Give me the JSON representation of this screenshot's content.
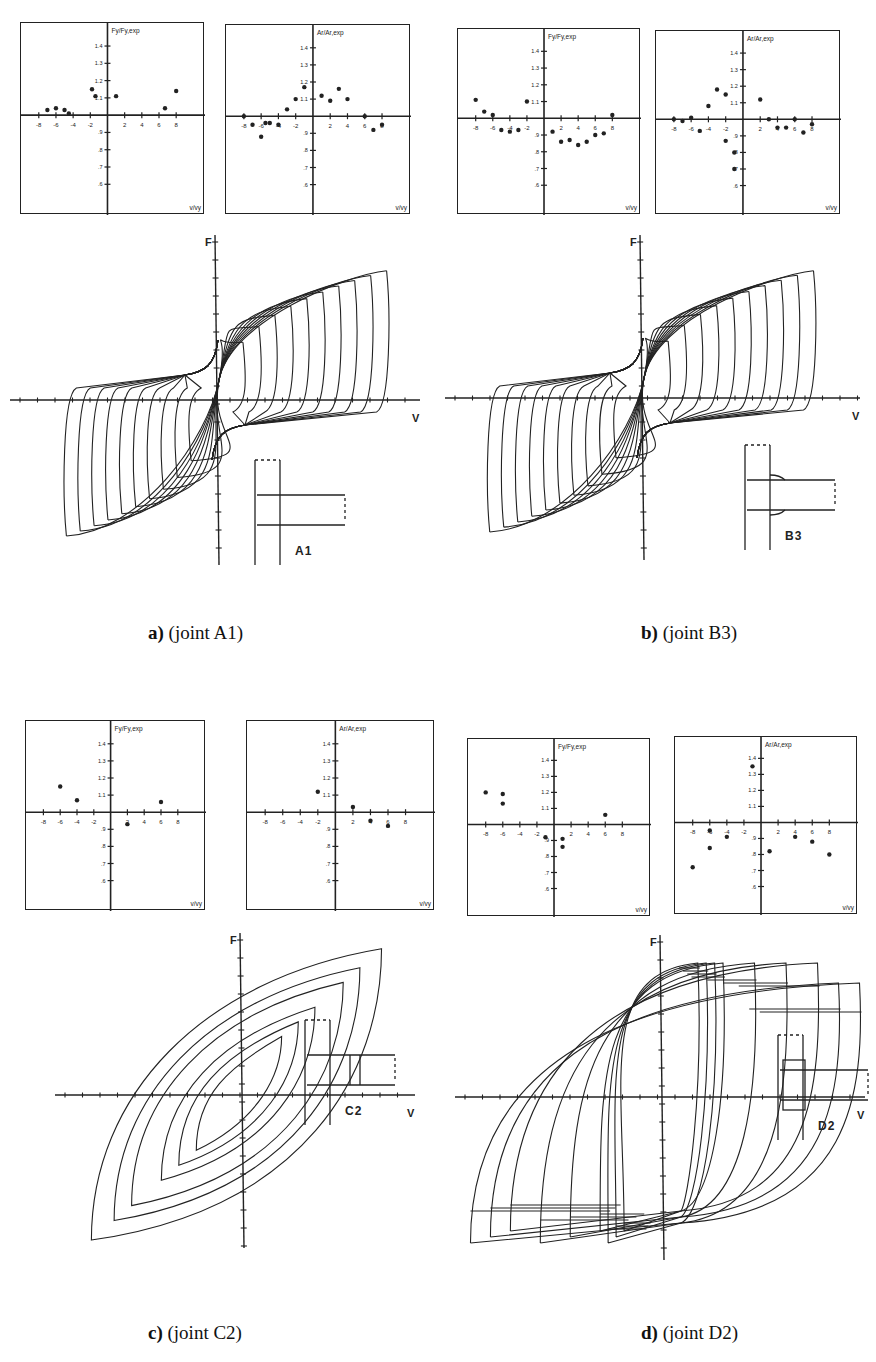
{
  "figure": {
    "panels": [
      {
        "id": "a",
        "caption_letter": "a)",
        "caption_text": " (joint A1)",
        "joint": "A1"
      },
      {
        "id": "b",
        "caption_letter": "b)",
        "caption_text": " (joint B3)",
        "joint": "B3"
      },
      {
        "id": "c",
        "caption_letter": "c)",
        "caption_text": " (joint C2)",
        "joint": "C2"
      },
      {
        "id": "d",
        "caption_letter": "d)",
        "caption_text": " (joint D2)",
        "joint": "D2"
      }
    ],
    "axis_labels": {
      "force_ratio": "Fy/Fy,exp",
      "area_ratio": "Ar/Ar,exp",
      "x_ratio": "v/vy",
      "hyst_y": "F",
      "hyst_x": "V"
    }
  },
  "chart_data": [
    {
      "panel": "a",
      "type": "scatter",
      "title": "Fy/Fy,exp vs v/vy (joint A1)",
      "xlabel": "v/vy",
      "ylabel": "Fy/Fy,exp",
      "xlim": [
        -10,
        10
      ],
      "ylim": [
        0.5,
        1.5
      ],
      "xticks": [
        -8,
        -6,
        -4,
        -2,
        2,
        4,
        6,
        8
      ],
      "yticks": [
        0.6,
        0.7,
        0.8,
        0.9,
        1.1,
        1.2,
        1.3,
        1.4
      ],
      "x": [
        -7,
        -6,
        -5,
        -4.5,
        -1.8,
        -1.4,
        1,
        6.7,
        8
      ],
      "y": [
        1.03,
        1.04,
        1.03,
        1.01,
        1.15,
        1.11,
        1.11,
        1.04,
        1.14
      ]
    },
    {
      "panel": "a",
      "type": "scatter",
      "title": "Ar/Ar,exp vs v/vy (joint A1)",
      "xlabel": "v/vy",
      "ylabel": "Ar/Ar,exp",
      "xlim": [
        -10,
        10
      ],
      "ylim": [
        0.5,
        1.5
      ],
      "xticks": [
        -8,
        -6,
        -4,
        -2,
        2,
        4,
        6,
        8
      ],
      "yticks": [
        0.6,
        0.7,
        0.8,
        0.9,
        1.1,
        1.2,
        1.3,
        1.4
      ],
      "x": [
        -8,
        -7,
        -6,
        -5.5,
        -5,
        -4,
        -3,
        -2,
        -1,
        1,
        2,
        3,
        4,
        6,
        7,
        8
      ],
      "y": [
        1.0,
        0.95,
        0.88,
        0.96,
        0.96,
        0.95,
        1.04,
        1.1,
        1.17,
        1.12,
        1.09,
        1.16,
        1.1,
        1.0,
        0.92,
        0.95
      ]
    },
    {
      "panel": "b",
      "type": "scatter",
      "title": "Fy/Fy,exp vs v/vy (joint B3)",
      "xlabel": "v/vy",
      "ylabel": "Fy/Fy,exp",
      "xlim": [
        -10,
        10
      ],
      "ylim": [
        0.5,
        1.5
      ],
      "xticks": [
        -8,
        -6,
        -4,
        -2,
        2,
        4,
        6,
        8
      ],
      "yticks": [
        0.6,
        0.7,
        0.8,
        0.9,
        1.1,
        1.2,
        1.3,
        1.4
      ],
      "x": [
        -8,
        -7,
        -6,
        -5,
        -4,
        -3,
        -2,
        1,
        2,
        3,
        4,
        5,
        6,
        7,
        8
      ],
      "y": [
        1.11,
        1.04,
        1.02,
        0.93,
        0.92,
        0.93,
        1.1,
        0.92,
        0.86,
        0.87,
        0.84,
        0.86,
        0.9,
        0.91,
        1.02
      ]
    },
    {
      "panel": "b",
      "type": "scatter",
      "title": "Ar/Ar,exp vs v/vy (joint B3)",
      "xlabel": "v/vy",
      "ylabel": "Ar/Ar,exp",
      "xlim": [
        -10,
        10
      ],
      "ylim": [
        0.5,
        1.5
      ],
      "xticks": [
        -8,
        -6,
        -4,
        -2,
        2,
        4,
        6,
        8
      ],
      "yticks": [
        0.6,
        0.7,
        0.8,
        0.9,
        1.1,
        1.2,
        1.3,
        1.4
      ],
      "x": [
        -8,
        -7,
        -6,
        -5,
        -4,
        -3,
        -2,
        -2,
        -1,
        -1,
        2,
        3,
        4,
        5,
        6,
        7,
        8
      ],
      "y": [
        1.0,
        0.99,
        1.01,
        0.93,
        1.08,
        1.18,
        1.15,
        0.87,
        0.8,
        0.7,
        1.12,
        1.0,
        0.95,
        0.95,
        1.0,
        0.92,
        0.97
      ]
    },
    {
      "panel": "c",
      "type": "scatter",
      "title": "Fy/Fy,exp vs v/vy (joint C2)",
      "xlabel": "v/vy",
      "ylabel": "Fy/Fy,exp",
      "xlim": [
        -10,
        10
      ],
      "ylim": [
        0.5,
        1.5
      ],
      "xticks": [
        -8,
        -6,
        -4,
        -2,
        2,
        4,
        6,
        8
      ],
      "yticks": [
        0.6,
        0.7,
        0.8,
        0.9,
        1.1,
        1.2,
        1.3,
        1.4
      ],
      "x": [
        -6,
        -4,
        2,
        6
      ],
      "y": [
        1.15,
        1.07,
        0.93,
        1.06
      ]
    },
    {
      "panel": "c",
      "type": "scatter",
      "title": "Ar/Ar,exp vs v/vy (joint C2)",
      "xlabel": "v/vy",
      "ylabel": "Ar/Ar,exp",
      "xlim": [
        -10,
        10
      ],
      "ylim": [
        0.5,
        1.5
      ],
      "xticks": [
        -8,
        -6,
        -4,
        -2,
        2,
        4,
        6,
        8
      ],
      "yticks": [
        0.6,
        0.7,
        0.8,
        0.9,
        1.1,
        1.2,
        1.3,
        1.4
      ],
      "x": [
        -2,
        2,
        4,
        6
      ],
      "y": [
        1.12,
        1.03,
        0.95,
        0.92
      ]
    },
    {
      "panel": "d",
      "type": "scatter",
      "title": "Fy/Fy,exp vs v/vy (joint D2)",
      "xlabel": "v/vy",
      "ylabel": "Fy/Fy,exp",
      "xlim": [
        -10,
        10
      ],
      "ylim": [
        0.5,
        1.5
      ],
      "xticks": [
        -8,
        -6,
        -4,
        -2,
        2,
        4,
        6,
        8
      ],
      "yticks": [
        0.6,
        0.7,
        0.8,
        0.9,
        1.1,
        1.2,
        1.3,
        1.4
      ],
      "x": [
        -8,
        -6,
        -6,
        -1,
        1,
        1,
        6
      ],
      "y": [
        1.2,
        1.19,
        1.13,
        0.92,
        0.91,
        0.86,
        1.06
      ]
    },
    {
      "panel": "d",
      "type": "scatter",
      "title": "Ar/Ar,exp vs v/vy (joint D2)",
      "xlabel": "v/vy",
      "ylabel": "Ar/Ar,exp",
      "xlim": [
        -10,
        10
      ],
      "ylim": [
        0.5,
        1.5
      ],
      "xticks": [
        -8,
        -6,
        -4,
        -2,
        2,
        4,
        6,
        8
      ],
      "yticks": [
        0.6,
        0.7,
        0.8,
        0.9,
        1.1,
        1.2,
        1.3,
        1.4
      ],
      "x": [
        -8,
        -6,
        -6,
        -4,
        -1,
        1,
        4,
        6,
        8
      ],
      "y": [
        0.72,
        0.95,
        0.84,
        0.91,
        1.35,
        0.82,
        0.91,
        0.88,
        0.8
      ]
    },
    {
      "panel": "a",
      "type": "line",
      "title": "Hysteresis loops F–V (joint A1)",
      "xlabel": "V",
      "ylabel": "F",
      "note": "cyclic loading, increasing amplitude, pinched S-shaped loops"
    },
    {
      "panel": "b",
      "type": "line",
      "title": "Hysteresis loops F–V (joint B3)",
      "xlabel": "V",
      "ylabel": "F",
      "note": "cyclic loading, increasing amplitude, pinched S-shaped loops"
    },
    {
      "panel": "c",
      "type": "line",
      "title": "Hysteresis loops F–V (joint C2)",
      "xlabel": "V",
      "ylabel": "F",
      "note": "few large loops with cycle numbers, stable spindle shape"
    },
    {
      "panel": "d",
      "type": "line",
      "title": "Hysteresis loops F–V (joint D2)",
      "xlabel": "V",
      "ylabel": "F",
      "note": "many fat stable loops with strength degradation"
    }
  ]
}
